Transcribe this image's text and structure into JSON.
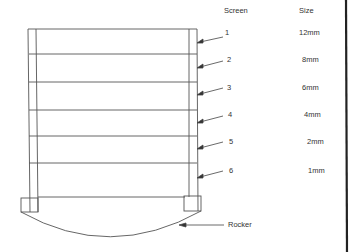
{
  "headers": {
    "screen": "Screen",
    "size": "Size"
  },
  "screens": [
    {
      "number": "1",
      "size": "12mm"
    },
    {
      "number": "2",
      "size": "8mm"
    },
    {
      "number": "3",
      "size": "6mm"
    },
    {
      "number": "4",
      "size": "4mm"
    },
    {
      "number": "5",
      "size": "2mm"
    },
    {
      "number": "6",
      "size": "1mm"
    }
  ],
  "rocker_label": "Rocker",
  "colors": {
    "line": "#555555",
    "border": "#222222",
    "text": "#333333"
  }
}
